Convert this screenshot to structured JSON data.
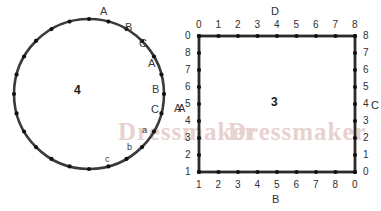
{
  "watermark": {
    "text": "Dressmaker",
    "color": "#e7d2cf"
  },
  "circle_figure": {
    "name": "dotted-circle",
    "center_label": "4",
    "dot_count": 24,
    "stroke_color": "#3b3b3b",
    "dot_color": "#111111",
    "arc_labels": [
      {
        "text": "A",
        "case": "upper"
      },
      {
        "text": "B",
        "case": "upper"
      },
      {
        "text": "C",
        "case": "upper"
      },
      {
        "text": "A",
        "case": "upper"
      },
      {
        "text": "B",
        "case": "upper"
      },
      {
        "text": "C",
        "case": "upper"
      },
      {
        "text": "a",
        "case": "lower"
      },
      {
        "text": "b",
        "case": "lower"
      },
      {
        "text": "c",
        "case": "lower"
      }
    ],
    "outside_label": "A"
  },
  "square_figure": {
    "name": "dotted-square",
    "center_label": "3",
    "stroke_color": "#2b2b2b",
    "dot_color": "#111111",
    "edges": {
      "top": {
        "label": "D",
        "ticks": [
          "0",
          "1",
          "2",
          "3",
          "4",
          "5",
          "6",
          "7",
          "8"
        ]
      },
      "bottom": {
        "label": "B",
        "ticks": [
          "1",
          "2",
          "3",
          "4",
          "5",
          "6",
          "7",
          "8",
          "0"
        ]
      },
      "right": {
        "label": "C",
        "ticks": [
          "8",
          "7",
          "6",
          "5",
          "4",
          "3",
          "2",
          "1",
          "0"
        ]
      },
      "left": {
        "label": "A",
        "ticks": [
          "0",
          "8",
          "7",
          "6",
          "5",
          "4",
          "3",
          "2",
          "1"
        ]
      }
    }
  }
}
